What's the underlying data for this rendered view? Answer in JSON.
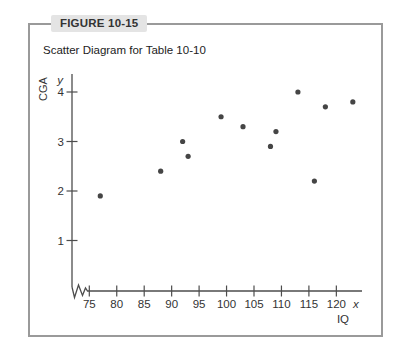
{
  "figure": {
    "label": "FIGURE 10-15",
    "title": "Scatter Diagram for Table 10-10"
  },
  "chart_data": {
    "type": "scatter",
    "title": "Scatter Diagram for Table 10-10",
    "xlabel": "IQ",
    "ylabel": "CGA",
    "x_axis_letter": "x",
    "y_axis_letter": "y",
    "x_ticks": [
      75,
      80,
      85,
      90,
      95,
      100,
      105,
      110,
      115,
      120
    ],
    "y_ticks": [
      1,
      2,
      3,
      4
    ],
    "xlim": [
      75,
      120
    ],
    "ylim": [
      0,
      4.4
    ],
    "x_axis_break": true,
    "grid": false,
    "legend": "none",
    "points": [
      {
        "x": 77,
        "y": 1.9
      },
      {
        "x": 88,
        "y": 2.4
      },
      {
        "x": 92,
        "y": 3.0
      },
      {
        "x": 93,
        "y": 2.7
      },
      {
        "x": 99,
        "y": 3.5
      },
      {
        "x": 103,
        "y": 3.3
      },
      {
        "x": 108,
        "y": 2.9
      },
      {
        "x": 109,
        "y": 3.2
      },
      {
        "x": 113,
        "y": 4.0
      },
      {
        "x": 116,
        "y": 2.2
      },
      {
        "x": 118,
        "y": 3.7
      },
      {
        "x": 123,
        "y": 3.8
      }
    ]
  },
  "colors": {
    "box_border": "#9a9a9a",
    "label_bg": "#e4e4e4",
    "text": "#333333",
    "axis": "#4d4d4d",
    "point": "#454545"
  }
}
